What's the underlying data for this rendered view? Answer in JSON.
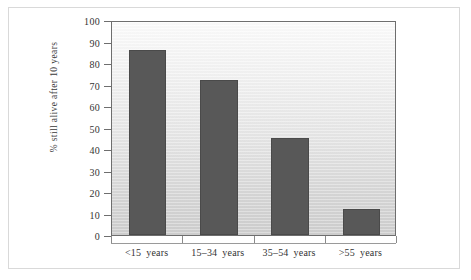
{
  "chart_data": {
    "type": "bar",
    "title": "",
    "subtitle": "",
    "xlabel": "",
    "ylabel": "% still alive after 10  years",
    "categories": [
      "<15  years",
      "15–34  years",
      "35–54  years",
      ">55  years"
    ],
    "values": [
      86,
      72,
      45,
      12
    ],
    "ylim": [
      0,
      100
    ],
    "ytick_values": [
      0,
      10,
      20,
      30,
      40,
      50,
      60,
      70,
      80,
      90,
      100
    ],
    "ytick_labels": [
      "0",
      "10",
      "20",
      "30",
      "40",
      "50",
      "60",
      "70",
      "80",
      "90",
      "100"
    ],
    "grid": false,
    "legend": null,
    "legend_position": "none",
    "bar_color": "#585858",
    "bar_edge_color": "#4a4a4a",
    "plot_background_top": "#fcfcfc",
    "plot_background_bottom": "#cfcfcf",
    "axis_color": "#6e6e6e",
    "text_color": "#333333",
    "frame_color": "#d9d9d9",
    "page_background": "#ffffff"
  },
  "axis": {
    "y_title": "% still alive after 10  years"
  },
  "categories_parts": [
    {
      "range": "<15",
      "unit": "years"
    },
    {
      "range": "15–34",
      "unit": "years"
    },
    {
      "range": "35–54",
      "unit": "years"
    },
    {
      "range": ">55",
      "unit": "years"
    }
  ]
}
